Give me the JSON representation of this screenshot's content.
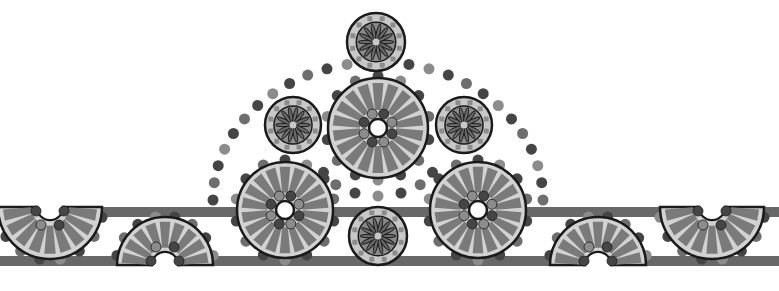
{
  "canvas": {
    "width": 779,
    "height": 291,
    "background": "#ffffff"
  },
  "colors": {
    "outline": "#1a1a1a",
    "wheel_fill": "#d2d2d2",
    "spoke": "#7a7a7a",
    "bar": "#686868",
    "dot_dark": "#454545",
    "dot_mid": "#6e6e6e",
    "dot_light": "#8c8c8c",
    "rosette_ring": "#c8c8c8",
    "rosette_inner": "#8a8a8a",
    "rosette_petal": "#6a6a6a",
    "hub": "#ffffff"
  },
  "bars": [
    {
      "name": "top-bar",
      "y": 207,
      "height": 10
    },
    {
      "name": "bottom-bar",
      "y": 256,
      "height": 10
    }
  ],
  "wheels": [
    {
      "name": "center-top-wheel",
      "cx": 378,
      "cy": 128,
      "r": 50,
      "spokes": 18
    },
    {
      "name": "left-wheel",
      "cx": 285,
      "cy": 210,
      "r": 48,
      "spokes": 18
    },
    {
      "name": "right-wheel",
      "cx": 478,
      "cy": 210,
      "r": 48,
      "spokes": 18
    }
  ],
  "half_wheels": [
    {
      "name": "half-wheel-top-left",
      "cx": 50,
      "cy": 207,
      "r": 52,
      "dir": "down"
    },
    {
      "name": "half-wheel-bottom-left",
      "cx": 165,
      "cy": 265,
      "r": 48,
      "dir": "up"
    },
    {
      "name": "half-wheel-bottom-right",
      "cx": 598,
      "cy": 265,
      "r": 48,
      "dir": "up"
    },
    {
      "name": "half-wheel-top-right",
      "cx": 712,
      "cy": 207,
      "r": 52,
      "dir": "down"
    }
  ],
  "rosettes": [
    {
      "name": "rosette-top",
      "cx": 376,
      "cy": 42,
      "r": 29,
      "petals": 14
    },
    {
      "name": "rosette-left",
      "cx": 293,
      "cy": 125,
      "r": 28,
      "petals": 14
    },
    {
      "name": "rosette-right",
      "cx": 464,
      "cy": 125,
      "r": 28,
      "petals": 14
    },
    {
      "name": "rosette-bottom",
      "cx": 378,
      "cy": 236,
      "r": 29,
      "petals": 14
    }
  ],
  "dotted_arcs": [
    {
      "name": "outer-arc",
      "cx": 378,
      "cy": 200,
      "rx": 165,
      "ry": 138,
      "start": 180,
      "end": 360,
      "count": 26,
      "dot_r": 5.5
    },
    {
      "name": "inner-arc",
      "cx": 378,
      "cy": 160,
      "rx": 58,
      "ry": 36,
      "start": 20,
      "end": 160,
      "count": 7,
      "dot_r": 5.5
    }
  ]
}
